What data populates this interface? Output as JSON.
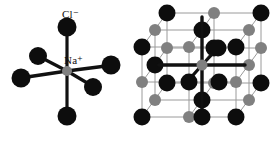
{
  "figure": {
    "background_color": "#ffffff",
    "width": 275,
    "height": 145
  },
  "colors": {
    "chloride_sphere": "#0d0d0d",
    "sodium_sphere": "#808080",
    "bond_bold": "#111111",
    "lattice_edge": "#9a9a9a",
    "lattice_bond_thin": "#8c8c8c",
    "label_text": "#111111"
  },
  "panels": {
    "octahedron": {
      "name": "octahedral-coordination-diagram",
      "labels": [
        {
          "id": "chloride",
          "ion": "Cl",
          "charge": "−",
          "text": "Cl⁻"
        },
        {
          "id": "sodium",
          "ion": "Na",
          "charge": "+",
          "text": "Na⁺"
        }
      ],
      "center_ion": "Na+",
      "ligand_ion": "Cl-",
      "coordination_number": 6,
      "geometry": "octahedral"
    },
    "lattice": {
      "name": "cubic-crystal-lattice-diagram",
      "structure": "rock-salt",
      "grid": "3x3x3",
      "black_sphere_ion": "Cl-",
      "gray_sphere_ion": "Na+",
      "highlighted_center_ion": "Na+",
      "highlighted_bonds": 6
    }
  },
  "legend": {
    "chloride_label": "Cl⁻",
    "sodium_label": "Na⁺"
  }
}
